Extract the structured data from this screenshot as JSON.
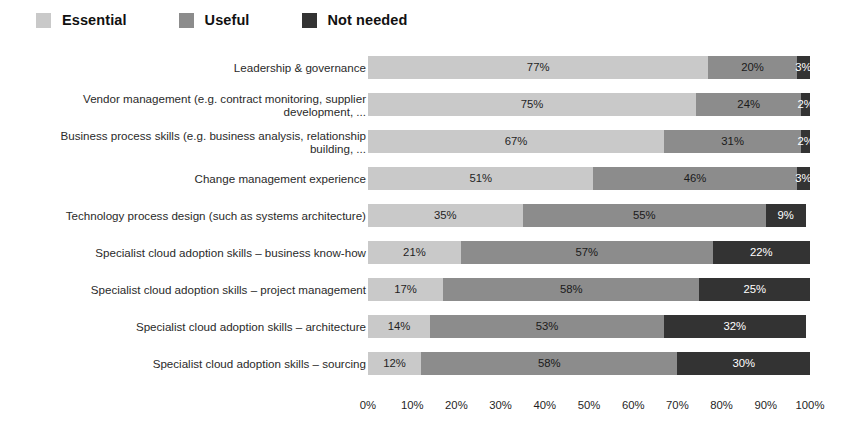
{
  "legend": {
    "position": "top-left",
    "items": [
      {
        "label": "Essential",
        "color": "#c9c9c9",
        "key": "essential"
      },
      {
        "label": "Useful",
        "color": "#8c8c8c",
        "key": "useful"
      },
      {
        "label": "Not needed",
        "color": "#333333",
        "key": "notneeded"
      }
    ]
  },
  "chart_data": {
    "type": "bar",
    "orientation": "horizontal",
    "stacked": true,
    "stack_total": 100,
    "title": "",
    "subtitle": "",
    "xlabel": "",
    "ylabel": "",
    "xlim": [
      0,
      100
    ],
    "grid": false,
    "value_suffix": "%",
    "legend_position": "top-left",
    "axis_ticks": [
      "0%",
      "10%",
      "20%",
      "30%",
      "40%",
      "50%",
      "60%",
      "70%",
      "80%",
      "90%",
      "100%"
    ],
    "axis_tick_values": [
      0,
      10,
      20,
      30,
      40,
      50,
      60,
      70,
      80,
      90,
      100
    ],
    "categories": [
      "Leadership & governance",
      "Vendor management (e.g. contract monitoring, supplier\ndevelopment, ...",
      "Business process skills (e.g. business analysis, relationship\nbuilding, ...",
      "Change management experience",
      "Technology process design (such as systems architecture)",
      "Specialist cloud adoption skills – business know-how",
      "Specialist cloud adoption skills – project management",
      "Specialist cloud adoption skills – architecture",
      "Specialist cloud adoption skills – sourcing"
    ],
    "series": [
      {
        "name": "Essential",
        "color": "#c9c9c9",
        "values": [
          77,
          75,
          67,
          51,
          35,
          21,
          17,
          14,
          12
        ]
      },
      {
        "name": "Useful",
        "color": "#8c8c8c",
        "values": [
          20,
          24,
          31,
          46,
          55,
          57,
          58,
          53,
          58
        ]
      },
      {
        "name": "Not needed",
        "color": "#333333",
        "values": [
          3,
          2,
          2,
          3,
          9,
          22,
          25,
          32,
          30
        ]
      }
    ],
    "rows": [
      {
        "label": "Leadership & governance",
        "essential": 77,
        "useful": 20,
        "notneeded": 3,
        "labels": [
          "77%",
          "20%",
          "3%"
        ]
      },
      {
        "label": "Vendor management (e.g. contract monitoring, supplier\ndevelopment, ...",
        "essential": 75,
        "useful": 24,
        "notneeded": 2,
        "labels": [
          "75%",
          "24%",
          "2%"
        ]
      },
      {
        "label": "Business process skills (e.g. business analysis, relationship\nbuilding, ...",
        "essential": 67,
        "useful": 31,
        "notneeded": 2,
        "labels": [
          "67%",
          "31%",
          "2%"
        ]
      },
      {
        "label": "Change management experience",
        "essential": 51,
        "useful": 46,
        "notneeded": 3,
        "labels": [
          "51%",
          "46%",
          "3%"
        ]
      },
      {
        "label": "Technology process design (such as systems architecture)",
        "essential": 35,
        "useful": 55,
        "notneeded": 9,
        "labels": [
          "35%",
          "55%",
          "9%"
        ]
      },
      {
        "label": "Specialist cloud adoption skills – business know-how",
        "essential": 21,
        "useful": 57,
        "notneeded": 22,
        "labels": [
          "21%",
          "57%",
          "22%"
        ]
      },
      {
        "label": "Specialist cloud adoption skills – project management",
        "essential": 17,
        "useful": 58,
        "notneeded": 25,
        "labels": [
          "17%",
          "58%",
          "25%"
        ]
      },
      {
        "label": "Specialist cloud adoption skills – architecture",
        "essential": 14,
        "useful": 53,
        "notneeded": 32,
        "labels": [
          "14%",
          "53%",
          "32%"
        ]
      },
      {
        "label": "Specialist cloud adoption skills – sourcing",
        "essential": 12,
        "useful": 58,
        "notneeded": 30,
        "labels": [
          "12%",
          "58%",
          "30%"
        ]
      }
    ]
  }
}
